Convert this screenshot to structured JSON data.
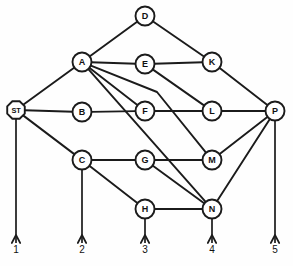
{
  "diagram": {
    "type": "node-link-graph",
    "background_color": "#ffffff",
    "line_color": "#1b1b1b",
    "node_fill": "#ffffff"
  },
  "nodes": [
    {
      "id": "D",
      "label": "D",
      "x": 145,
      "y": 16,
      "r": 9.5,
      "shape": "circle"
    },
    {
      "id": "A",
      "label": "A",
      "x": 82,
      "y": 62,
      "r": 9.5,
      "shape": "circle"
    },
    {
      "id": "E",
      "label": "E",
      "x": 145,
      "y": 64,
      "r": 9.5,
      "shape": "circle"
    },
    {
      "id": "K",
      "label": "K",
      "x": 212,
      "y": 62,
      "r": 9.5,
      "shape": "circle"
    },
    {
      "id": "ST",
      "label": "ST",
      "x": 16,
      "y": 110,
      "r": 9.5,
      "shape": "octagon"
    },
    {
      "id": "B",
      "label": "B",
      "x": 82,
      "y": 112,
      "r": 9.5,
      "shape": "circle"
    },
    {
      "id": "F",
      "label": "F",
      "x": 145,
      "y": 111,
      "r": 9.5,
      "shape": "circle"
    },
    {
      "id": "L",
      "label": "L",
      "x": 212,
      "y": 111,
      "r": 9.5,
      "shape": "circle"
    },
    {
      "id": "P",
      "label": "P",
      "x": 275,
      "y": 111,
      "r": 9.5,
      "shape": "circle"
    },
    {
      "id": "C",
      "label": "C",
      "x": 82,
      "y": 160,
      "r": 9.5,
      "shape": "circle"
    },
    {
      "id": "G",
      "label": "G",
      "x": 145,
      "y": 160,
      "r": 9.5,
      "shape": "circle"
    },
    {
      "id": "M",
      "label": "M",
      "x": 212,
      "y": 160,
      "r": 9.5,
      "shape": "circle"
    },
    {
      "id": "H",
      "label": "H",
      "x": 145,
      "y": 209,
      "r": 9.5,
      "shape": "circle"
    },
    {
      "id": "N",
      "label": "N",
      "x": 212,
      "y": 209,
      "r": 9.5,
      "shape": "circle"
    }
  ],
  "edges": [
    {
      "from": "D",
      "to": "A",
      "kind": "straight"
    },
    {
      "from": "D",
      "to": "K",
      "kind": "straight"
    },
    {
      "from": "A",
      "to": "E",
      "kind": "straight"
    },
    {
      "from": "E",
      "to": "K",
      "kind": "straight"
    },
    {
      "from": "A",
      "to": "ST",
      "kind": "straight"
    },
    {
      "from": "A",
      "to": "F",
      "kind": "straight"
    },
    {
      "from": "A",
      "to": "M",
      "kind": "bent",
      "bend_x": 157,
      "bend_y": 92
    },
    {
      "from": "A",
      "to": "N",
      "kind": "straight"
    },
    {
      "from": "E",
      "to": "L",
      "kind": "straight"
    },
    {
      "from": "K",
      "to": "P",
      "kind": "straight"
    },
    {
      "from": "ST",
      "to": "B",
      "kind": "straight"
    },
    {
      "from": "B",
      "to": "F",
      "kind": "straight"
    },
    {
      "from": "F",
      "to": "L",
      "kind": "straight"
    },
    {
      "from": "L",
      "to": "P",
      "kind": "straight"
    },
    {
      "from": "ST",
      "to": "C",
      "kind": "straight"
    },
    {
      "from": "C",
      "to": "G",
      "kind": "straight"
    },
    {
      "from": "G",
      "to": "M",
      "kind": "straight"
    },
    {
      "from": "G",
      "to": "N",
      "kind": "straight"
    },
    {
      "from": "M",
      "to": "P",
      "kind": "straight"
    },
    {
      "from": "N",
      "to": "P",
      "kind": "straight"
    },
    {
      "from": "C",
      "to": "H",
      "kind": "straight"
    },
    {
      "from": "H",
      "to": "N",
      "kind": "straight"
    }
  ],
  "terminals": [
    {
      "label": "1",
      "from": "ST",
      "x": 16,
      "y_end": 243,
      "label_y": 246
    },
    {
      "label": "2",
      "from": "C",
      "x": 82,
      "y_end": 243,
      "label_y": 246
    },
    {
      "label": "3",
      "from": "H",
      "x": 145,
      "y_end": 243,
      "label_y": 246
    },
    {
      "label": "4",
      "from": "N",
      "x": 212,
      "y_end": 243,
      "label_y": 246
    },
    {
      "label": "5",
      "from": "P",
      "x": 275,
      "y_end": 243,
      "label_y": 246
    }
  ]
}
